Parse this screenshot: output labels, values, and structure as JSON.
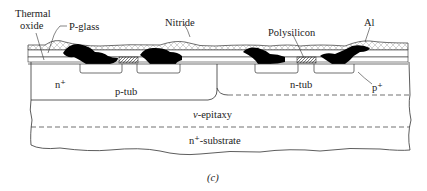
{
  "figure": {
    "caption": "(c)"
  },
  "labels": {
    "thermal_oxide_1": "Thermal",
    "thermal_oxide_2": "oxide",
    "p_glass": "P-glass",
    "nitride": "Nitride",
    "polysilicon": "Polysilicon",
    "al": "Al",
    "n_plus": "n⁺",
    "p_tub": "p-tub",
    "n_tub": "n-tub",
    "p_plus": "p⁺",
    "epitaxy_prefix": "ν",
    "epitaxy_suffix": "-epitaxy",
    "substrate": "n⁺-substrate"
  },
  "colors": {
    "line": "#333333",
    "metal": "#000000",
    "poly_hatch": "#555555",
    "nitride_hatch": "#b8b8b8",
    "background": "#ffffff"
  }
}
